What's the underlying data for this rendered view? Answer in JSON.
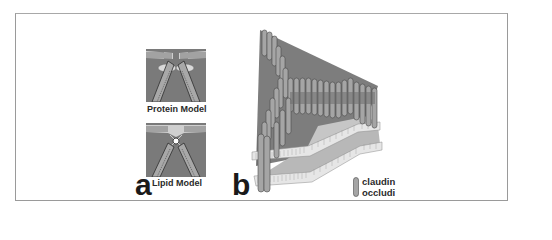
{
  "figure": {
    "panels": [
      {
        "label": "a",
        "subfigures": [
          {
            "caption": "Protein Model"
          },
          {
            "caption": "Lipid Model"
          }
        ]
      },
      {
        "label": "b",
        "legend": {
          "items": [
            "claudin",
            "occludi"
          ]
        }
      }
    ]
  },
  "colors": {
    "frame_border": "#9a9a9a",
    "membrane_dark": "#6f6f6f",
    "membrane_mid": "#8a8a8a",
    "membrane_light": "#c8c8c8",
    "protein_fill": "#a9a9a9",
    "protein_dark": "#555555"
  }
}
